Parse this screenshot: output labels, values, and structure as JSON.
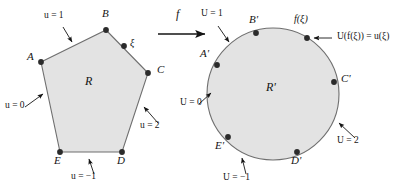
{
  "figure": {
    "map_label": "f",
    "colors": {
      "fill": "#e3e3e3",
      "stroke": "#6f6f6f",
      "point": "#2b2b2b",
      "text": "#141414",
      "arrow": "#141414"
    }
  },
  "domain_region": {
    "name": "R",
    "label": "R",
    "vertices": [
      {
        "id": "A",
        "label": "A",
        "x": 41,
        "y": 62,
        "label_x": 27,
        "label_y": 57
      },
      {
        "id": "B",
        "label": "B",
        "x": 106,
        "y": 30,
        "label_x": 103,
        "label_y": 13
      },
      {
        "id": "C",
        "label": "C",
        "x": 148,
        "y": 73,
        "label_x": 157,
        "label_y": 68
      },
      {
        "id": "D",
        "label": "D",
        "x": 122,
        "y": 152,
        "label_x": 118,
        "label_y": 156
      },
      {
        "id": "E",
        "label": "E",
        "x": 60,
        "y": 152,
        "label_x": 55,
        "label_y": 156
      }
    ],
    "marked_point": {
      "id": "xi",
      "label": "ξ",
      "x": 124,
      "y": 46,
      "label_x": 130,
      "label_y": 39
    },
    "boundary_values": [
      {
        "label": "u = 1",
        "label_x": 45,
        "label_y": 18,
        "arrow_from_x": 63,
        "arrow_from_y": 27,
        "arrow_to_x": 74,
        "arrow_to_y": 44
      },
      {
        "label": "u = 0",
        "label_x": 6,
        "label_y": 108,
        "arrow_from_x": 25,
        "arrow_from_y": 107,
        "arrow_to_x": 45,
        "arrow_to_y": 93
      },
      {
        "label": "u = 2",
        "label_x": 141,
        "label_y": 128,
        "arrow_from_x": 158,
        "arrow_from_y": 123,
        "arrow_to_x": 142,
        "arrow_to_y": 105
      },
      {
        "label": "u = −1",
        "label_x": 73,
        "label_y": 179,
        "arrow_from_x": 94,
        "arrow_from_y": 174,
        "arrow_to_x": 88,
        "arrow_to_y": 158
      }
    ]
  },
  "image_region": {
    "name": "R'",
    "label": "R'",
    "circle": {
      "cx": 273,
      "cy": 94,
      "r": 66
    },
    "vertices": [
      {
        "id": "A'",
        "label": "A'",
        "x": 217,
        "y": 65,
        "label_x": 203,
        "label_y": 55
      },
      {
        "id": "B'",
        "label": "B'",
        "x": 256,
        "y": 33,
        "label_x": 250,
        "label_y": 19
      },
      {
        "id": "C'",
        "label": "C'",
        "x": 334,
        "y": 82,
        "label_x": 342,
        "label_y": 76
      },
      {
        "id": "D'",
        "label": "D'",
        "x": 297,
        "y": 152,
        "label_x": 292,
        "label_y": 156
      },
      {
        "id": "E'",
        "label": "E'",
        "x": 228,
        "y": 137,
        "label_x": 217,
        "label_y": 141
      }
    ],
    "marked_point": {
      "id": "f(xi)",
      "label": "f(ξ)",
      "x": 307,
      "y": 38,
      "label_x": 296,
      "label_y": 20
    },
    "annotation": {
      "text": "U(f(ξ)) = u(ξ)",
      "label_x": 334,
      "label_y": 33,
      "arrow_from_x": 332,
      "arrow_from_y": 38,
      "arrow_to_x": 313,
      "arrow_to_y": 38
    },
    "boundary_values": [
      {
        "label": "U = 1",
        "label_x": 203,
        "label_y": 16,
        "arrow_from_x": 218,
        "arrow_from_y": 26,
        "arrow_to_x": 231,
        "arrow_to_y": 44
      },
      {
        "label": "U = 0",
        "label_x": 181,
        "label_y": 104,
        "arrow_from_x": 199,
        "arrow_from_y": 104,
        "arrow_to_x": 213,
        "arrow_to_y": 92
      },
      {
        "label": "U = 2",
        "label_x": 338,
        "label_y": 143,
        "arrow_from_x": 355,
        "arrow_from_y": 138,
        "arrow_to_x": 337,
        "arrow_to_y": 121
      },
      {
        "label": "U = −1",
        "label_x": 225,
        "label_y": 180,
        "arrow_from_x": 246,
        "arrow_from_y": 174,
        "arrow_to_x": 241,
        "arrow_to_y": 157
      }
    ]
  },
  "map_arrow": {
    "label": "f",
    "label_x": 176,
    "label_y": 15,
    "from_x": 158,
    "from_y": 34,
    "to_x": 209,
    "to_y": 34
  }
}
